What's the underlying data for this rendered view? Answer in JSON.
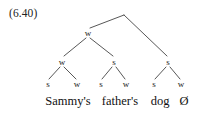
{
  "figure": {
    "example_number": "(6.40)",
    "caption_text": "Sammy's father's dog Ø",
    "line_color": "#444444",
    "text_color": "#1a1a1a",
    "background_color": "#ffffff"
  },
  "tree": {
    "root": {
      "label": "",
      "x": 124,
      "y": 14
    },
    "level2": [
      {
        "label": "w",
        "x": 88,
        "y": 33
      },
      {
        "label": "s",
        "x": 168,
        "y": 62
      }
    ],
    "level3": [
      {
        "label": "w",
        "x": 62,
        "y": 62
      },
      {
        "label": "s",
        "x": 114,
        "y": 62
      }
    ],
    "terminals": [
      {
        "label": "s",
        "x": 48,
        "y": 84
      },
      {
        "label": "w",
        "x": 77,
        "y": 84
      },
      {
        "label": "s",
        "x": 101,
        "y": 84
      },
      {
        "label": "w",
        "x": 126,
        "y": 84
      },
      {
        "label": "s",
        "x": 154,
        "y": 84
      },
      {
        "label": "w",
        "x": 181,
        "y": 84
      }
    ],
    "words": [
      {
        "text": "Sammy's",
        "x": 68,
        "y": 95
      },
      {
        "text": "father's",
        "x": 120,
        "y": 95
      },
      {
        "text": "dog",
        "x": 160,
        "y": 95
      },
      {
        "text": "Ø",
        "x": 184,
        "y": 95
      }
    ],
    "edges": [
      {
        "from": "root",
        "to": "level2-w",
        "x1": 124,
        "y1": 15,
        "x2": 90,
        "y2": 28
      },
      {
        "from": "root",
        "to": "level2-s",
        "x1": 124,
        "y1": 15,
        "x2": 167,
        "y2": 56
      },
      {
        "from": "level2-w",
        "to": "level3-w",
        "x1": 86,
        "y1": 38,
        "x2": 64,
        "y2": 56
      },
      {
        "from": "level2-w",
        "to": "level3-s",
        "x1": 90,
        "y1": 38,
        "x2": 113,
        "y2": 56
      },
      {
        "from": "level3-w",
        "to": "terminal-1",
        "x1": 60,
        "y1": 67,
        "x2": 49,
        "y2": 79
      },
      {
        "from": "level3-w",
        "to": "terminal-2",
        "x1": 64,
        "y1": 67,
        "x2": 76,
        "y2": 79
      },
      {
        "from": "level3-s",
        "to": "terminal-3",
        "x1": 112,
        "y1": 67,
        "x2": 102,
        "y2": 79
      },
      {
        "from": "level3-s",
        "to": "terminal-4",
        "x1": 116,
        "y1": 67,
        "x2": 125,
        "y2": 79
      },
      {
        "from": "level2-s",
        "to": "terminal-5",
        "x1": 166,
        "y1": 67,
        "x2": 155,
        "y2": 79
      },
      {
        "from": "level2-s",
        "to": "terminal-6",
        "x1": 170,
        "y1": 67,
        "x2": 180,
        "y2": 79
      }
    ]
  }
}
